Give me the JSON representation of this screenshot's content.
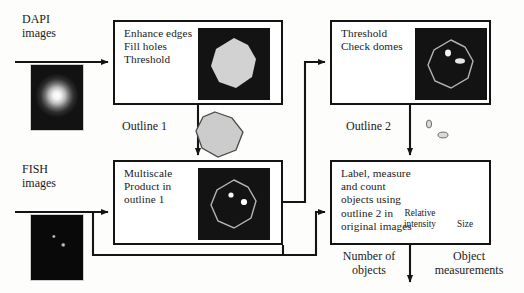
{
  "diagram": {
    "inputs": [
      {
        "name": "dapi",
        "label": "DAPI\nimages",
        "x": 22,
        "y": 12
      },
      {
        "name": "fish",
        "label": "FISH\nimages",
        "x": 22,
        "y": 162
      }
    ],
    "boxes": [
      {
        "name": "enhance-threshold",
        "text": "Enhance edges\nFill holes\nThreshold",
        "x": 113,
        "y": 20,
        "w": 170,
        "h": 85
      },
      {
        "name": "multiscale-product",
        "text": "Multiscale\nProduct in\noutline 1",
        "x": 113,
        "y": 160,
        "w": 170,
        "h": 85
      },
      {
        "name": "threshold-check-domes",
        "text": "Threshold\nCheck domes",
        "x": 330,
        "y": 20,
        "w": 161,
        "h": 85
      },
      {
        "name": "label-measure-count",
        "text": "Label, measure\nand count\nobjects using\noutline 2 in\noriginal images",
        "x": 330,
        "y": 160,
        "w": 161,
        "h": 85
      }
    ],
    "edge_labels": [
      {
        "name": "outline-1",
        "text": "Outline 1",
        "x": 122,
        "y": 119
      },
      {
        "name": "outline-2",
        "text": "Outline 2",
        "x": 346,
        "y": 119
      }
    ],
    "outputs": [
      {
        "name": "number-of-objects",
        "text": "Number of\nobjects",
        "x": 330,
        "y": 249
      },
      {
        "name": "object-measurements",
        "text": "Object\nmeasurements",
        "x": 412,
        "y": 249
      }
    ],
    "annotations": [
      {
        "name": "relative-intensity",
        "text": "Relative\nintensity",
        "x": 404,
        "y": 208
      },
      {
        "name": "size",
        "text": "Size",
        "x": 457,
        "y": 219
      }
    ],
    "thumbnails": [
      {
        "name": "dapi-input-thumbnail",
        "kind": "nucleus-blob",
        "x": 30,
        "y": 64,
        "w": 52,
        "h": 65
      },
      {
        "name": "fish-input-thumbnail",
        "kind": "fish-dots",
        "x": 30,
        "y": 214,
        "w": 52,
        "h": 65
      },
      {
        "name": "segmented-nucleus-thumbnail",
        "kind": "filled-nucleus",
        "x": 198,
        "y": 27,
        "w": 72,
        "h": 72
      },
      {
        "name": "multiscale-result-thumbnail",
        "kind": "outline-with-dots",
        "x": 198,
        "y": 167,
        "w": 72,
        "h": 72
      },
      {
        "name": "domes-thumbnail",
        "kind": "outline-with-domes",
        "x": 413,
        "y": 27,
        "w": 72,
        "h": 72
      }
    ],
    "shapes": [
      {
        "name": "outline-1-shape",
        "kind": "grey-polygon",
        "x": 196,
        "y": 112,
        "w": 48,
        "h": 46
      },
      {
        "name": "outline-2-shape",
        "kind": "small-blobs",
        "x": 424,
        "y": 118,
        "w": 30,
        "h": 26
      }
    ],
    "colors": {
      "line": "#141414",
      "box_fill": "#ffffff",
      "thumb_dark": "#0a0a0a",
      "blob_grey": "#c9c9c9",
      "outline_grey": "#b9b9b9",
      "background": "#fdfdfb"
    }
  }
}
